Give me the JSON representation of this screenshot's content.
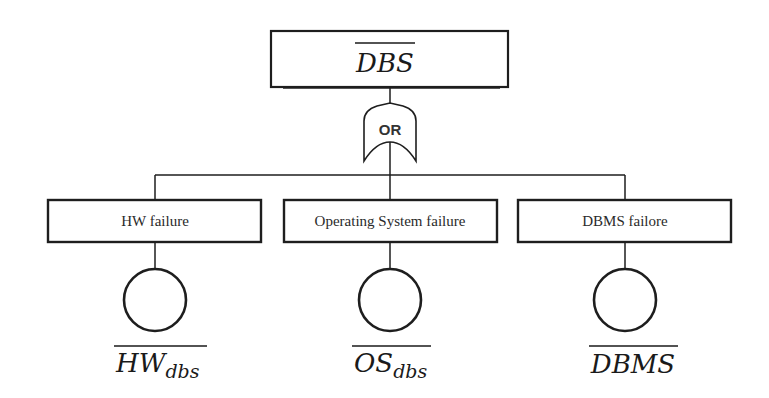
{
  "diagram": {
    "type": "fault-tree",
    "top_event": {
      "label": "DBS",
      "negated": true
    },
    "gate": {
      "type": "OR",
      "label": "OR"
    },
    "intermediate_events": [
      {
        "label": "HW failure"
      },
      {
        "label": "Operating System failure"
      },
      {
        "label": "DBMS failore"
      }
    ],
    "basic_events": [
      {
        "main": "HW",
        "subscript": "dbs",
        "negated": true
      },
      {
        "main": "OS",
        "subscript": "dbs",
        "negated": true
      },
      {
        "main": "DBMS",
        "subscript": "",
        "negated": true
      }
    ],
    "colors": {
      "line": "#1e1e1e",
      "background": "#ffffff",
      "text": "#2a2a2a"
    }
  }
}
